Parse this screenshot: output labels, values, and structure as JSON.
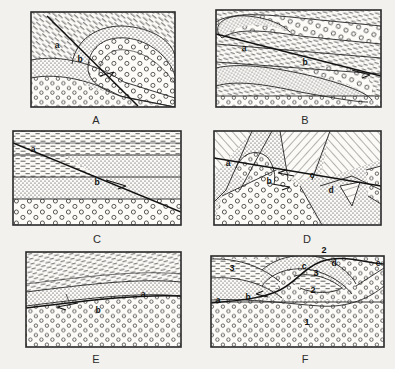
{
  "figure": {
    "background_color": "#f2f1ee",
    "ink_color": "#222222",
    "panel_count": 6,
    "columns": 2,
    "rows": 3
  },
  "legend": {
    "patterns": [
      {
        "name": "dash-pattern",
        "rock": "shale",
        "description": "short horizontal dashes"
      },
      {
        "name": "stipple-pattern",
        "rock": "sandstone",
        "description": "fine dense dots"
      },
      {
        "name": "circle-pattern",
        "rock": "conglomerate",
        "description": "open circles"
      },
      {
        "name": "hachure-pattern",
        "rock": "schist",
        "description": "inclined hatch lines"
      }
    ]
  },
  "panels": [
    {
      "id": "A",
      "caption": "A",
      "structure": "overturned fold cut by a normal fault",
      "labels": [
        {
          "text": "a",
          "x": 57,
          "y": 45
        },
        {
          "text": "b",
          "x": 80,
          "y": 59
        }
      ],
      "fault": {
        "type": "normal",
        "has_arrow": true
      }
    },
    {
      "id": "B",
      "caption": "B",
      "structure": "recumbent fold with nearly horizontal fault",
      "labels": [
        {
          "text": "a",
          "x": 244,
          "y": 48
        },
        {
          "text": "b",
          "x": 305,
          "y": 62
        }
      ],
      "fault": {
        "type": "thrust",
        "has_arrow": true
      }
    },
    {
      "id": "C",
      "caption": "C",
      "structure": "horizontal strata displaced by an inclined fault",
      "labels": [
        {
          "text": "a",
          "x": 33,
          "y": 149
        },
        {
          "text": "b",
          "x": 97,
          "y": 182
        }
      ],
      "fault": {
        "type": "normal",
        "has_arrow": true
      }
    },
    {
      "id": "D",
      "caption": "D",
      "structure": "complex folded and faulted block with four contacts",
      "labels": [
        {
          "text": "a",
          "x": 228,
          "y": 163
        },
        {
          "text": "b",
          "x": 269,
          "y": 181
        },
        {
          "text": "c",
          "x": 312,
          "y": 175
        },
        {
          "text": "d",
          "x": 331,
          "y": 190
        }
      ],
      "fault": {
        "type": "low-angle",
        "has_arrow": true
      }
    },
    {
      "id": "E",
      "caption": "E",
      "structure": "gently dipping beds truncated by a bedding-plane thrust",
      "labels": [
        {
          "text": "a",
          "x": 143,
          "y": 294
        },
        {
          "text": "b",
          "x": 98,
          "y": 309
        }
      ],
      "fault": {
        "type": "thrust",
        "has_arrow": true
      }
    },
    {
      "id": "F",
      "caption": "F",
      "structure": "asymmetric fold over a conglomerate basement, five contacts",
      "labels": [
        {
          "text": "a",
          "x": 218,
          "y": 300
        },
        {
          "text": "b",
          "x": 248,
          "y": 297
        },
        {
          "text": "c",
          "x": 304,
          "y": 266
        },
        {
          "text": "d",
          "x": 333,
          "y": 263
        },
        {
          "text": "e",
          "x": 378,
          "y": 264
        }
      ],
      "units": [
        {
          "text": "1",
          "x": 307,
          "y": 322
        },
        {
          "text": "2",
          "x": 324,
          "y": 250
        },
        {
          "text": "2",
          "x": 313,
          "y": 290
        },
        {
          "text": "3",
          "x": 232,
          "y": 268
        },
        {
          "text": "3",
          "x": 316,
          "y": 273
        }
      ],
      "fault": {
        "type": "bedding",
        "has_arrow": true
      }
    }
  ]
}
